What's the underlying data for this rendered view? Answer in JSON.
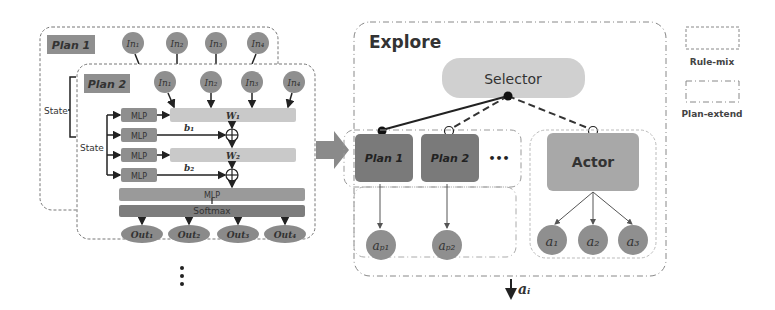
{
  "left_panel": {
    "plan1": {
      "title": "Plan 1",
      "inputs": [
        "In₁",
        "In₂",
        "In₃",
        "In₄"
      ]
    },
    "plan2": {
      "title": "Plan 2",
      "inputs": [
        "In₁",
        "In₂",
        "In₃",
        "In₄"
      ],
      "state_label_outer": "State",
      "state_label_inner": "State",
      "mlp_labels": [
        "MLP",
        "MLP",
        "MLP",
        "MLP"
      ],
      "weights": [
        "W₁",
        "W₂"
      ],
      "biases": [
        "b₁",
        "b₂"
      ],
      "mlp_bar": "MLP",
      "softmax_bar": "Softmax",
      "outputs": [
        "Out₁",
        "Out₂",
        "Out₃",
        "Out₄"
      ]
    },
    "ellipsis": "⋮"
  },
  "explore": {
    "title": "Explore",
    "selector": "Selector",
    "plans": [
      "Plan 1",
      "Plan 2"
    ],
    "plans_ellipsis": "•••",
    "actor": "Actor",
    "plan_actions": [
      "aₚ₁",
      "aₚ₂"
    ],
    "actor_actions": [
      "a₁",
      "a₂",
      "a₃"
    ],
    "output_action": "aᵢ"
  },
  "legend": {
    "items": [
      {
        "label": "Rule-mix",
        "style": "dashed"
      },
      {
        "label": "Plan-extend",
        "style": "dash-dot"
      }
    ]
  },
  "colors": {
    "node_gray": "#8f8f8f",
    "dark_box": "#7a7a7a",
    "light_bar": "#c9c9c9",
    "selector": "#d0d0d0",
    "actor": "#a8a8a8",
    "arrow": "#222222"
  }
}
